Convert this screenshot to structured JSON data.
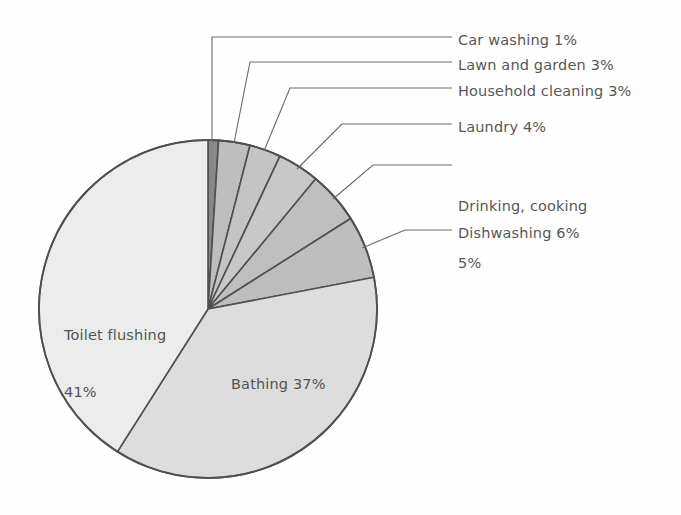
{
  "chart_data": {
    "type": "pie",
    "title": "",
    "subtitle": "",
    "xlabel": "",
    "ylabel": "",
    "legend_position": "callout-right",
    "grid": false,
    "start_angle_deg": 0,
    "direction": "clockwise",
    "categories": [
      "Car washing",
      "Lawn and garden",
      "Household cleaning",
      "Laundry",
      "Drinking, cooking",
      "Dishwashing",
      "Bathing",
      "Toilet flushing"
    ],
    "values": [
      1,
      3,
      3,
      4,
      5,
      6,
      37,
      41
    ],
    "unit": "%",
    "slice_colors": [
      "#6f6f6f",
      "#b0b0b0",
      "#b8b8b8",
      "#bdbdbd",
      "#b2b2b2",
      "#b0b0b0",
      "#d6d6d6",
      "#e9e9e9"
    ],
    "outline_color": "#2b2b2b",
    "labels": [
      {
        "text": "Car washing 1%",
        "placement": "callout"
      },
      {
        "text": "Lawn and garden 3%",
        "placement": "callout"
      },
      {
        "text": "Household cleaning 3%",
        "placement": "callout"
      },
      {
        "text": "Laundry 4%",
        "placement": "callout"
      },
      {
        "text": "Drinking, cooking",
        "text2": "5%",
        "placement": "callout"
      },
      {
        "text": "Dishwashing 6%",
        "placement": "callout"
      },
      {
        "text": "Bathing 37%",
        "placement": "inside"
      },
      {
        "text": "Toilet flushing",
        "text2": "41%",
        "placement": "inside"
      }
    ]
  },
  "callouts": {
    "car_washing": "Car washing 1%",
    "lawn_and_garden": "Lawn and garden 3%",
    "household_cleaning": "Household cleaning 3%",
    "laundry": "Laundry 4%",
    "drinking_cooking_line1": "Drinking, cooking",
    "drinking_cooking_line2": "5%",
    "dishwashing": "Dishwashing 6%"
  },
  "inside_labels": {
    "toilet_flushing_line1": "Toilet flushing",
    "toilet_flushing_line2": "41%",
    "bathing": "Bathing 37%"
  },
  "geometry": {
    "center_x": 208,
    "center_y": 309,
    "radius": 169
  }
}
